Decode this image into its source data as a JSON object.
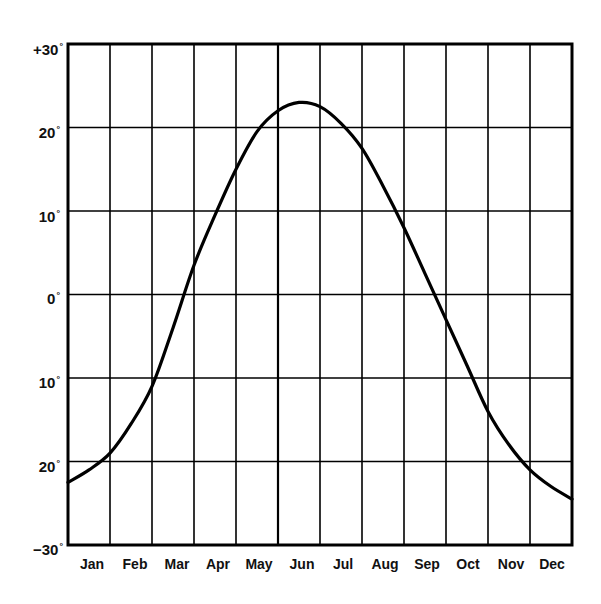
{
  "chart_data": {
    "type": "line",
    "title": "",
    "xlabel": "",
    "ylabel": "",
    "categories": [
      "Jan",
      "Feb",
      "Mar",
      "Apr",
      "May",
      "Jun",
      "Jul",
      "Aug",
      "Sep",
      "Oct",
      "Nov",
      "Dec"
    ],
    "x_ticks": [
      "Jan",
      "Feb",
      "Mar",
      "Apr",
      "May",
      "Jun",
      "Jul",
      "Aug",
      "Sep",
      "Oct",
      "Nov",
      "Dec"
    ],
    "y_ticks": [
      "+30°",
      "20°",
      "10°",
      "0°",
      "10°",
      "20°",
      "−30°"
    ],
    "y_tick_values": [
      30,
      20,
      10,
      0,
      -10,
      -20,
      -30
    ],
    "ylim": [
      -30,
      30
    ],
    "grid": true,
    "legend": null,
    "series": [
      {
        "name": "curve",
        "x": [
          0,
          0.5,
          1,
          1.5,
          2,
          2.5,
          3,
          3.5,
          4,
          4.5,
          5,
          5.5,
          6,
          6.5,
          7,
          7.5,
          8,
          8.5,
          9,
          9.5,
          10,
          10.5,
          11,
          11.5,
          12
        ],
        "values": [
          -22.5,
          -21,
          -19,
          -15.5,
          -11,
          -4,
          3.5,
          9.5,
          15,
          19.5,
          22,
          23,
          22.5,
          20.5,
          17.5,
          13,
          8,
          2.5,
          -3,
          -8.5,
          -14,
          -18,
          -21,
          -23,
          -24.5
        ]
      }
    ],
    "style": {
      "line_color": "#000000",
      "grid_color": "#000000",
      "background": "#ffffff"
    }
  },
  "y_labels": [
    {
      "text": "+30",
      "deg": "°"
    },
    {
      "text": "20",
      "deg": "°"
    },
    {
      "text": "10",
      "deg": "°"
    },
    {
      "text": "0",
      "deg": "°"
    },
    {
      "text": "10",
      "deg": "°"
    },
    {
      "text": "20",
      "deg": "°"
    },
    {
      "text": "−30",
      "deg": "°"
    }
  ],
  "x_labels": [
    "Jan",
    "Feb",
    "Mar",
    "Apr",
    "May",
    "Jun",
    "Jul",
    "Aug",
    "Sep",
    "Oct",
    "Nov",
    "Dec"
  ]
}
